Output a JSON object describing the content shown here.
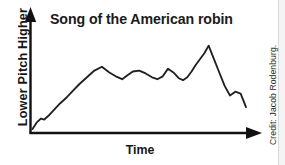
{
  "chart_data": {
    "type": "line",
    "title": "Song of the American robin",
    "xlabel": "Time",
    "ylabel": "Lower  Pitch  Higher",
    "grid": false,
    "legend": null,
    "axis_style": "arrow-axes",
    "xlim": [
      0,
      100
    ],
    "ylim": [
      0,
      100
    ],
    "x_tick_labels": [],
    "y_tick_labels": [],
    "series": [
      {
        "name": "robin song pitch contour",
        "x": [
          0.0,
          2.0,
          4.0,
          5.5,
          8.0,
          10.5,
          13.0,
          16.0,
          19.0,
          22.0,
          25.5,
          29.0,
          32.5,
          36.0,
          39.0,
          42.0,
          44.5,
          47.0,
          50.0,
          53.0,
          56.0,
          58.5,
          61.0,
          63.5,
          66.0,
          68.5,
          70.5,
          72.5,
          74.5,
          76.5,
          78.5,
          80.5,
          82.5,
          85.0,
          87.5,
          90.0,
          92.5,
          95.0,
          97.5,
          100.0
        ],
        "y": [
          3.0,
          10.0,
          14.0,
          13.0,
          18.0,
          24.0,
          30.0,
          36.0,
          43.0,
          50.0,
          57.0,
          64.0,
          68.0,
          62.0,
          58.0,
          55.0,
          59.0,
          63.0,
          64.0,
          61.0,
          57.0,
          55.0,
          58.0,
          66.0,
          62.0,
          56.0,
          54.0,
          57.0,
          63.0,
          70.0,
          76.0,
          82.0,
          90.0,
          76.0,
          62.0,
          48.0,
          38.0,
          42.0,
          40.0,
          26.0
        ]
      }
    ]
  },
  "credit": {
    "text": "Credit: Jacob Rodenburg."
  }
}
